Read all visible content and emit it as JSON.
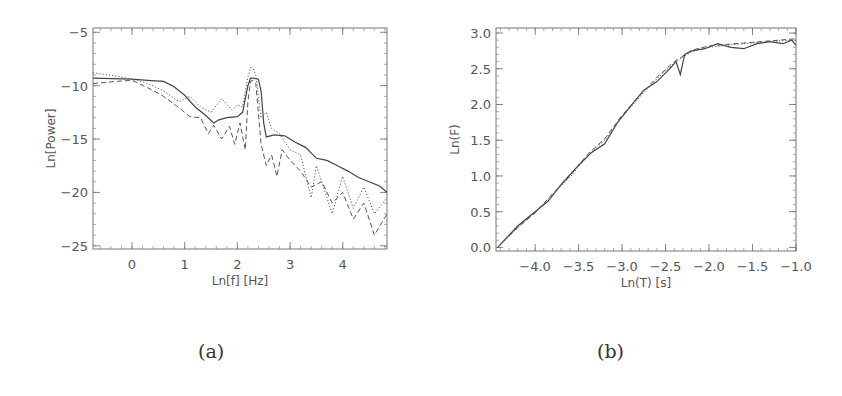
{
  "figure": {
    "captions": [
      "(a)",
      "(b)"
    ]
  },
  "chart_data": [
    {
      "id": "a",
      "type": "line",
      "title": "",
      "xlabel": "Ln[f] [Hz]",
      "ylabel": "Ln[Power]",
      "xlim": [
        -0.74,
        4.84
      ],
      "ylim": [
        -25.3,
        -4.6
      ],
      "xticks": [
        0,
        1,
        2,
        3,
        4
      ],
      "xtick_labels": [
        "0",
        "1",
        "2",
        "3",
        "4"
      ],
      "yticks": [
        -5,
        -10,
        -15,
        -20,
        -25
      ],
      "ytick_labels": [
        "-5",
        "-10",
        "-15",
        "-20",
        "-25"
      ],
      "grid": false,
      "legend": null,
      "series": [
        {
          "name": "solid",
          "style": "solid",
          "x": [
            -0.74,
            0.0,
            0.3,
            0.6,
            0.8,
            1.0,
            1.2,
            1.4,
            1.55,
            1.65,
            1.8,
            2.0,
            2.1,
            2.2,
            2.25,
            2.3,
            2.4,
            2.45,
            2.5,
            2.55,
            2.7,
            2.9,
            3.1,
            3.3,
            3.5,
            3.7,
            3.9,
            4.1,
            4.3,
            4.5,
            4.7,
            4.84
          ],
          "y": [
            -9.3,
            -9.4,
            -9.5,
            -9.6,
            -10.1,
            -10.9,
            -12.0,
            -12.8,
            -13.5,
            -13.2,
            -13.0,
            -12.9,
            -12.5,
            -10.0,
            -9.3,
            -9.3,
            -9.4,
            -10.5,
            -13.5,
            -14.8,
            -14.6,
            -14.7,
            -15.3,
            -15.8,
            -16.8,
            -17.0,
            -17.5,
            -18.0,
            -18.6,
            -19.0,
            -19.4,
            -20.0
          ]
        },
        {
          "name": "dashed",
          "style": "dashed",
          "x": [
            -0.74,
            -0.3,
            0.0,
            0.3,
            0.6,
            0.9,
            1.1,
            1.3,
            1.45,
            1.55,
            1.7,
            1.85,
            1.95,
            2.05,
            2.15,
            2.2,
            2.25,
            2.3,
            2.35,
            2.45,
            2.55,
            2.65,
            2.75,
            2.85,
            3.0,
            3.2,
            3.4,
            3.6,
            3.8,
            4.0,
            4.2,
            4.4,
            4.6,
            4.84
          ],
          "y": [
            -9.8,
            -9.6,
            -9.5,
            -10.2,
            -11.0,
            -12.1,
            -12.9,
            -13.0,
            -14.5,
            -13.7,
            -15.0,
            -13.8,
            -15.5,
            -13.5,
            -16.0,
            -11.5,
            -9.6,
            -9.5,
            -9.8,
            -15.5,
            -17.5,
            -16.5,
            -18.5,
            -16.0,
            -17.0,
            -18.0,
            -19.5,
            -19.0,
            -21.0,
            -20.0,
            -22.5,
            -21.0,
            -24.0,
            -22.0
          ]
        },
        {
          "name": "dotted",
          "style": "dotted",
          "x": [
            -0.74,
            -0.3,
            0.0,
            0.3,
            0.6,
            0.9,
            1.1,
            1.3,
            1.5,
            1.7,
            1.9,
            2.0,
            2.1,
            2.2,
            2.25,
            2.3,
            2.35,
            2.45,
            2.55,
            2.65,
            2.8,
            3.0,
            3.2,
            3.4,
            3.5,
            3.6,
            3.8,
            4.0,
            4.2,
            4.4,
            4.6,
            4.84
          ],
          "y": [
            -8.8,
            -9.1,
            -9.4,
            -9.8,
            -10.5,
            -11.5,
            -11.0,
            -12.0,
            -12.5,
            -11.2,
            -12.3,
            -11.8,
            -12.0,
            -9.2,
            -8.3,
            -8.4,
            -9.0,
            -13.0,
            -12.5,
            -14.0,
            -14.5,
            -16.0,
            -16.5,
            -20.5,
            -17.5,
            -19.0,
            -22.0,
            -18.5,
            -21.5,
            -19.5,
            -22.0,
            -20.5
          ]
        }
      ]
    },
    {
      "id": "b",
      "type": "line",
      "title": "",
      "xlabel": "Ln(T) [s]",
      "ylabel": "Ln(F)",
      "xlim": [
        -4.45,
        -1.0
      ],
      "ylim": [
        -0.05,
        3.07
      ],
      "xticks": [
        -4.0,
        -3.5,
        -3.0,
        -2.5,
        -2.0,
        -1.5,
        -1.0
      ],
      "xtick_labels": [
        "-4.0",
        "-3.5",
        "-3.0",
        "-2.5",
        "-2.0",
        "-1.5",
        "-1.0"
      ],
      "yticks": [
        0.0,
        0.5,
        1.0,
        1.5,
        2.0,
        2.5,
        3.0
      ],
      "ytick_labels": [
        "0.0",
        "0.5",
        "1.0",
        "1.5",
        "2.0",
        "2.5",
        "3.0"
      ],
      "grid": false,
      "legend": null,
      "series": [
        {
          "name": "solid",
          "style": "solid",
          "x": [
            -4.43,
            -4.2,
            -4.0,
            -3.85,
            -3.7,
            -3.5,
            -3.35,
            -3.2,
            -3.05,
            -2.9,
            -2.75,
            -2.6,
            -2.45,
            -2.38,
            -2.33,
            -2.28,
            -2.2,
            -2.05,
            -1.9,
            -1.75,
            -1.6,
            -1.45,
            -1.3,
            -1.15,
            -1.05,
            -1.0
          ],
          "y": [
            0.0,
            0.3,
            0.5,
            0.65,
            0.88,
            1.15,
            1.33,
            1.45,
            1.75,
            1.98,
            2.2,
            2.32,
            2.5,
            2.6,
            2.42,
            2.7,
            2.75,
            2.78,
            2.85,
            2.8,
            2.78,
            2.85,
            2.88,
            2.85,
            2.9,
            2.83
          ]
        },
        {
          "name": "dashed",
          "style": "dashed",
          "x": [
            -4.43,
            -4.2,
            -4.0,
            -3.8,
            -3.6,
            -3.4,
            -3.2,
            -3.0,
            -2.8,
            -2.6,
            -2.4,
            -2.2,
            -2.0,
            -1.8,
            -1.6,
            -1.4,
            -1.2,
            -1.0
          ],
          "y": [
            0.0,
            0.28,
            0.48,
            0.75,
            1.0,
            1.3,
            1.52,
            1.85,
            2.12,
            2.38,
            2.6,
            2.76,
            2.82,
            2.84,
            2.86,
            2.88,
            2.9,
            2.92
          ]
        },
        {
          "name": "dotted",
          "style": "dotted",
          "x": [
            -4.43,
            -4.2,
            -4.0,
            -3.8,
            -3.6,
            -3.4,
            -3.2,
            -3.0,
            -2.8,
            -2.6,
            -2.4,
            -2.2,
            -2.0,
            -1.8,
            -1.6,
            -1.4,
            -1.2,
            -1.0
          ],
          "y": [
            0.0,
            0.27,
            0.5,
            0.74,
            0.98,
            1.28,
            1.5,
            1.83,
            2.1,
            2.36,
            2.58,
            2.74,
            2.8,
            2.83,
            2.85,
            2.87,
            2.89,
            2.9
          ]
        }
      ]
    }
  ]
}
